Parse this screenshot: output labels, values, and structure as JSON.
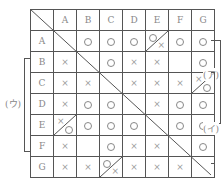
{
  "columns": [
    "",
    "A",
    "B",
    "C",
    "D",
    "E",
    "F",
    "G"
  ],
  "rows": [
    {
      "label": "A",
      "cells": [
        "\\",
        "O",
        "O",
        "O",
        "O/×",
        "O",
        "O"
      ]
    },
    {
      "label": "B",
      "cells": [
        "×",
        "\\",
        "O",
        "×",
        "×",
        "",
        "O"
      ]
    },
    {
      "label": "C",
      "cells": [
        "×",
        "×",
        "\\",
        "×",
        "×",
        "×",
        "×/O"
      ]
    },
    {
      "label": "D",
      "cells": [
        "×",
        "O",
        "O",
        "\\",
        "×",
        "O",
        "O"
      ]
    },
    {
      "label": "E",
      "cells": [
        "×/O",
        "O",
        "O",
        "O",
        "\\",
        "O",
        "O"
      ]
    },
    {
      "label": "F",
      "cells": [
        "×",
        "",
        "O",
        "×",
        "×",
        "\\",
        "O"
      ]
    },
    {
      "label": "G",
      "cells": [
        "×",
        "×",
        "O/×",
        "×",
        "×",
        "×",
        "\\"
      ]
    }
  ],
  "brackets": {
    "a": {
      "label": "(ア)",
      "from_row": "A",
      "to_row": "E",
      "side": "right"
    },
    "i": {
      "label": "(イ)",
      "from_row": "C",
      "to_row": "G",
      "side": "right"
    },
    "u": {
      "label": "(ウ)",
      "from_row": "B",
      "to_row": "F",
      "side": "left"
    }
  },
  "symbols": {
    "win": "O",
    "loss": "×"
  }
}
